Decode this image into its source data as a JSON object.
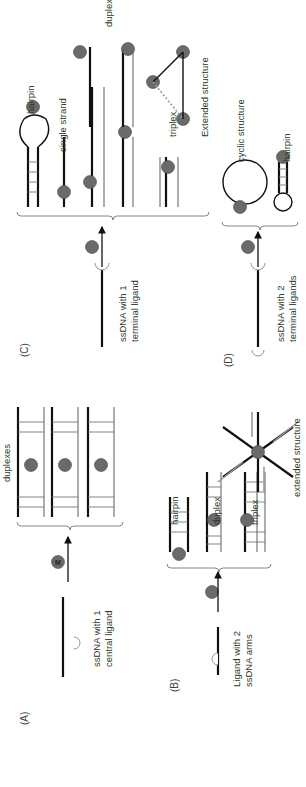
{
  "figure": {
    "orientation": "rotated -90deg (text reads bottom-to-top)",
    "metal_symbol": "M",
    "colors": {
      "background": "#ffffff",
      "strand_dark": "#111111",
      "strand_light": "#999999",
      "metal_fill": "#6a6a6a",
      "text": "#333333"
    }
  },
  "panels": {
    "A": {
      "label": "(A)",
      "start_label_line1": "ssDNA with 1",
      "start_label_line2": "central ligand",
      "product_group_label": "duplexes"
    },
    "B": {
      "label": "(B)",
      "start_label_line1": "Ligand with 2",
      "start_label_line2": "ssDNA arms",
      "products": [
        "hairpin",
        "duplex",
        "triplex",
        "extended structure"
      ]
    },
    "C": {
      "label": "(C)",
      "start_label_line1": "ssDNA with 1",
      "start_label_line2": "terminal ligand",
      "products": [
        "hairpin",
        "single strand",
        "duplexes",
        "triplex",
        "Extended structure"
      ]
    },
    "D": {
      "label": "(D)",
      "start_label_line1": "ssDNA with 2",
      "start_label_line2": "terminal ligands",
      "products": [
        "cyclic structure",
        "hairpin"
      ]
    }
  }
}
